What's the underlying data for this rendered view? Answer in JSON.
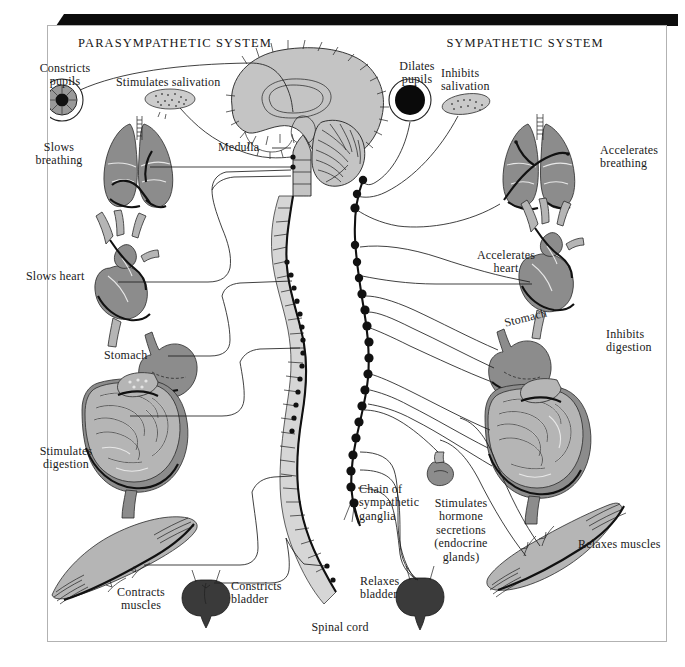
{
  "figure": {
    "title_parasympathetic": "PARASYMPATHETIC SYSTEM",
    "title_sympathetic": "SYMPATHETIC SYSTEM",
    "background_color": "#ffffff",
    "frame_color": "#b2b2b2",
    "frame_shadow_color": "#0d0d0d",
    "organ_fill": "#8c8c8c",
    "organ_fill_light": "#b8b8b8",
    "spine_fill": "#d4d4d4",
    "brain_fill": "#c2c2c2",
    "line_color": "#1a1a1a",
    "text_color": "#1a1a1a"
  },
  "parasympathetic": {
    "heading": "PARASYMPATHETIC SYSTEM",
    "labels": [
      {
        "id": "constricts-pupils",
        "text": "Constricts\npupils",
        "x": 26,
        "y": 62,
        "w": 78,
        "align": "center"
      },
      {
        "id": "stimulates-salivation",
        "text": "Stimulates salivation",
        "x": 116,
        "y": 76,
        "w": 150,
        "align": "left"
      },
      {
        "id": "slows-breathing",
        "text": "Slows\nbreathing",
        "x": 24,
        "y": 141,
        "w": 70,
        "align": "center"
      },
      {
        "id": "medulla",
        "text": "Medulla",
        "x": 218,
        "y": 141,
        "w": 52,
        "align": "left"
      },
      {
        "id": "slows-heart",
        "text": "Slows heart",
        "x": 26,
        "y": 270,
        "w": 82,
        "align": "left"
      },
      {
        "id": "stomach-left",
        "text": "Stomach",
        "x": 104,
        "y": 349,
        "w": 56,
        "align": "left"
      },
      {
        "id": "stimulates-digestion",
        "text": "Stimulates\ndigestion",
        "x": 26,
        "y": 445,
        "w": 80,
        "align": "center"
      },
      {
        "id": "contracts-muscles",
        "text": "Contracts\nmuscles",
        "x": 104,
        "y": 586,
        "w": 72,
        "align": "center"
      },
      {
        "id": "constricts-bladder",
        "text": "Constricts\nbladder",
        "x": 231,
        "y": 580,
        "w": 68,
        "align": "left"
      }
    ]
  },
  "sympathetic": {
    "heading": "SYMPATHETIC SYSTEM",
    "labels": [
      {
        "id": "dilates-pupils",
        "text": "Dilates\npupils",
        "x": 390,
        "y": 60,
        "w": 60,
        "align": "center"
      },
      {
        "id": "inhibits-salivation",
        "text": "Inhibits\nsalivation",
        "x": 441,
        "y": 67,
        "w": 70,
        "align": "left"
      },
      {
        "id": "accelerates-breathing",
        "text": "Accelerates\nbreathing",
        "x": 600,
        "y": 144,
        "w": 78,
        "align": "left"
      },
      {
        "id": "accelerates-heart",
        "text": "Accelerates\nheart",
        "x": 471,
        "y": 249,
        "w": 72,
        "align": "center"
      },
      {
        "id": "stomach-right",
        "text": "Stomach",
        "x": 505,
        "y": 317,
        "w": 56,
        "align": "left"
      },
      {
        "id": "inhibits-digestion",
        "text": "Inhibits\ndigestion",
        "x": 606,
        "y": 328,
        "w": 70,
        "align": "left"
      },
      {
        "id": "chain-of-ganglia",
        "text": "Chain of\nsympathetic\nganglia",
        "x": 359,
        "y": 483,
        "w": 76,
        "align": "left"
      },
      {
        "id": "stimulates-hormones",
        "text": "Stimulates\nhormone\nsecretions\n(endocrine\nglands)",
        "x": 424,
        "y": 497,
        "w": 76,
        "align": "center"
      },
      {
        "id": "relaxes-bladder",
        "text": "Relaxes\nbladder",
        "x": 360,
        "y": 575,
        "w": 56,
        "align": "left"
      },
      {
        "id": "relaxes-muscles",
        "text": "Relaxes muscles",
        "x": 578,
        "y": 538,
        "w": 104,
        "align": "left"
      }
    ]
  },
  "central": {
    "labels": [
      {
        "id": "spinal-cord",
        "text": "Spinal cord",
        "x": 302,
        "y": 621,
        "w": 74,
        "align": "center"
      }
    ]
  },
  "structures": {
    "brain": "mid-sagittal brain section with cerebral cortex, corpus callosum, thalamus, cerebellum and brainstem",
    "spinal_cord": "segmented vertebral column descending from medulla to sacrum",
    "ganglia_chain": "bead chain of sympathetic ganglia lateral to the spinal cord",
    "organs_left": [
      "eye",
      "salivary gland",
      "lungs",
      "heart",
      "stomach",
      "intestines",
      "skeletal muscle",
      "bladder"
    ],
    "organs_right": [
      "eye",
      "salivary gland",
      "lungs",
      "heart",
      "stomach",
      "intestines",
      "adrenal gland",
      "skeletal muscle",
      "bladder"
    ]
  }
}
